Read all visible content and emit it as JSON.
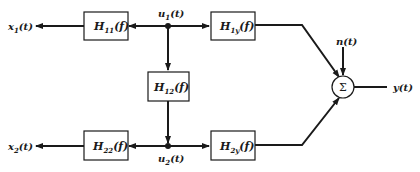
{
  "diagram": {
    "blocks": {
      "h11": {
        "label": "H",
        "sub": "11",
        "arg": "(f)"
      },
      "h1y": {
        "label": "H",
        "sub": "1y",
        "arg": "(f)"
      },
      "h12": {
        "label": "H",
        "sub": "12",
        "arg": "(f)"
      },
      "h22": {
        "label": "H",
        "sub": "22",
        "arg": "(f)"
      },
      "h2y": {
        "label": "H",
        "sub": "2y",
        "arg": "(f)"
      }
    },
    "signals": {
      "x1": {
        "label": "x",
        "sub": "1",
        "arg": "(t)"
      },
      "x2": {
        "label": "x",
        "sub": "2",
        "arg": "(t)"
      },
      "u1": {
        "label": "u",
        "sub": "1",
        "arg": "(t)"
      },
      "u2": {
        "label": "u",
        "sub": "2",
        "arg": "(t)"
      },
      "n": {
        "label": "n(t)"
      },
      "y": {
        "label": "y(t)"
      }
    },
    "summer": {
      "symbol": "Σ"
    }
  }
}
